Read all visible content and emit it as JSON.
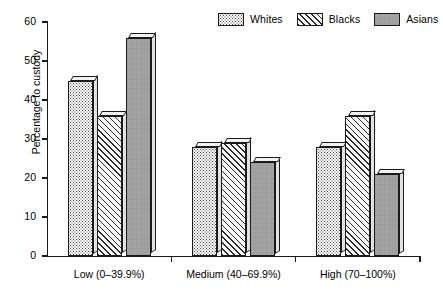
{
  "chart_data": {
    "type": "bar",
    "title": "",
    "xlabel": "",
    "ylabel": "Percentage to custody",
    "categories": [
      "Low (0–39.9%)",
      "Medium (40–69.9%)",
      "High (70–100%)"
    ],
    "series": [
      {
        "name": "Whites",
        "values": [
          45,
          28,
          28
        ],
        "pattern": "dotted",
        "color": "#fdfdfd"
      },
      {
        "name": "Blacks",
        "values": [
          36,
          29,
          36
        ],
        "pattern": "diagonal-hatch",
        "color": "#fbfbfb"
      },
      {
        "name": "Asians",
        "values": [
          56,
          24,
          21
        ],
        "pattern": "solid-gray",
        "color": "#9d9d9d"
      }
    ],
    "ylim": [
      0,
      60
    ],
    "yticks": [
      0,
      10,
      20,
      30,
      40,
      50,
      60
    ],
    "ytick_labels": [
      "0",
      "10",
      "20",
      "30",
      "40",
      "50",
      "60"
    ],
    "grid": false,
    "legend_position": "top-right",
    "axis_color": "#1a1a1a"
  },
  "legend": {
    "entries": [
      {
        "label": "Whites",
        "swatch": "dotted-swatch"
      },
      {
        "label": "Blacks",
        "swatch": "hatched-swatch"
      },
      {
        "label": "Asians",
        "swatch": "solid-gray-swatch"
      }
    ]
  },
  "axes": {
    "y_title": "Percentage to custody",
    "y_tick_labels": [
      "60",
      "50",
      "40",
      "30",
      "20",
      "10",
      "0"
    ],
    "x_group_labels": [
      "Low (0–39.9%)",
      "Medium (40–69.9%)",
      "High (70–100%)"
    ]
  }
}
